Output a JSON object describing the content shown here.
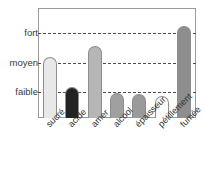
{
  "chart_data": {
    "type": "bar",
    "title": "",
    "subtitle": "",
    "xlabel": "",
    "ylabel": "",
    "categories": [
      "sucré",
      "acide",
      "amer",
      "alcool",
      "épaisseur",
      "pétillement",
      "fumée"
    ],
    "values": [
      2.0,
      1.0,
      2.35,
      0.82,
      0.78,
      0.72,
      3.0
    ],
    "series": [
      {
        "name": "intensité",
        "values": [
          2.0,
          1.0,
          2.35,
          0.82,
          0.78,
          0.72,
          3.0
        ]
      }
    ],
    "bar_colors": [
      "#e8e8e8",
      "#232323",
      "#b6b6b6",
      "#a0a0a0",
      "#9a9a9a",
      "#fbfbfb",
      "#8e8e8e"
    ],
    "ytick_labels": [
      "faible",
      "moyen",
      "fort"
    ],
    "ytick_values": [
      1,
      2,
      3
    ],
    "ylim": [
      0,
      3.55
    ],
    "grid": true,
    "grid_axis": "y",
    "grid_style": "dashed",
    "legend": false,
    "legend_position": "none",
    "frame": true,
    "xtick_rotation": -45,
    "annotations": []
  },
  "axis": {
    "y": {
      "ticks": [
        {
          "label": "fort",
          "value": 3
        },
        {
          "label": "moyen",
          "value": 2
        },
        {
          "label": "faible",
          "value": 1
        }
      ]
    },
    "x": {
      "ticks": [
        {
          "label": "sucré"
        },
        {
          "label": "acide"
        },
        {
          "label": "amer"
        },
        {
          "label": "alcool"
        },
        {
          "label": "épaisseur"
        },
        {
          "label": "pétillement"
        },
        {
          "label": "fumée"
        }
      ]
    }
  },
  "colors": {
    "frame": "#9b9b9b",
    "grid": "#4a4a4a",
    "text": "#2f2f2f",
    "background": "#ffffff"
  }
}
